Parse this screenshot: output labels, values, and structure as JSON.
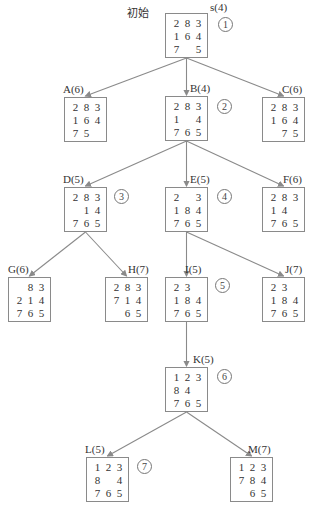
{
  "diagram": {
    "type": "search-tree",
    "start_label": "初始",
    "nodes": [
      {
        "id": "s",
        "label": "s(4)",
        "order": "1",
        "x": 165,
        "y": 13,
        "lx": 210,
        "ly": 1,
        "ox": 218,
        "oy": 17,
        "tiles": [
          "2",
          "8",
          "3",
          "1",
          "6",
          "4",
          "7",
          "",
          "5"
        ]
      },
      {
        "id": "A",
        "label": "A(6)",
        "order": "",
        "x": 64,
        "y": 97,
        "lx": 63,
        "ly": 83,
        "tiles": [
          "2",
          "8",
          "3",
          "1",
          "6",
          "4",
          "7",
          "5",
          ""
        ]
      },
      {
        "id": "B",
        "label": "B(4)",
        "order": "2",
        "x": 165,
        "y": 96,
        "lx": 190,
        "ly": 82,
        "ox": 217,
        "oy": 99,
        "tiles": [
          "2",
          "8",
          "3",
          "1",
          "",
          "4",
          "7",
          "6",
          "5"
        ]
      },
      {
        "id": "C",
        "label": "C(6)",
        "order": "",
        "x": 262,
        "y": 97,
        "lx": 282,
        "ly": 83,
        "tiles": [
          "2",
          "8",
          "3",
          "1",
          "6",
          "4",
          "",
          "7",
          "5"
        ]
      },
      {
        "id": "D",
        "label": "D(5)",
        "order": "3",
        "x": 64,
        "y": 187,
        "lx": 63,
        "ly": 173,
        "ox": 114,
        "oy": 189,
        "tiles": [
          "2",
          "8",
          "3",
          "",
          "1",
          "4",
          "7",
          "6",
          "5"
        ]
      },
      {
        "id": "E",
        "label": "E(5)",
        "order": "4",
        "x": 165,
        "y": 187,
        "lx": 190,
        "ly": 173,
        "ox": 217,
        "oy": 189,
        "tiles": [
          "2",
          "",
          "3",
          "1",
          "8",
          "4",
          "7",
          "6",
          "5"
        ]
      },
      {
        "id": "F",
        "label": "F(6)",
        "order": "",
        "x": 262,
        "y": 187,
        "lx": 283,
        "ly": 173,
        "tiles": [
          "2",
          "8",
          "3",
          "1",
          "4",
          "",
          "7",
          "6",
          "5"
        ]
      },
      {
        "id": "G",
        "label": "G(6)",
        "order": "",
        "x": 8,
        "y": 277,
        "lx": 8,
        "ly": 263,
        "tiles": [
          "",
          "8",
          "3",
          "2",
          "1",
          "4",
          "7",
          "6",
          "5"
        ]
      },
      {
        "id": "H",
        "label": "H(7)",
        "order": "",
        "x": 105,
        "y": 277,
        "lx": 128,
        "ly": 263,
        "tiles": [
          "2",
          "8",
          "3",
          "7",
          "1",
          "4",
          "",
          "6",
          "5"
        ]
      },
      {
        "id": "I",
        "label": "I(5)",
        "order": "5",
        "x": 165,
        "y": 277,
        "lx": 185,
        "ly": 263,
        "ox": 215,
        "oy": 278,
        "tiles": [
          "2",
          "3",
          "",
          "1",
          "8",
          "4",
          "7",
          "6",
          "5"
        ]
      },
      {
        "id": "J",
        "label": "J(7)",
        "order": "",
        "x": 262,
        "y": 277,
        "lx": 285,
        "ly": 263,
        "tiles": [
          "2",
          "3",
          "",
          "1",
          "8",
          "4",
          "7",
          "6",
          "5"
        ]
      },
      {
        "id": "K",
        "label": "K(5)",
        "order": "6",
        "x": 165,
        "y": 367,
        "lx": 193,
        "ly": 353,
        "ox": 217,
        "oy": 369,
        "tiles": [
          "1",
          "2",
          "3",
          "8",
          "4",
          "",
          "7",
          "6",
          "5"
        ]
      },
      {
        "id": "L",
        "label": "L(5)",
        "order": "7",
        "x": 86,
        "y": 457,
        "lx": 85,
        "ly": 443,
        "ox": 137,
        "oy": 459,
        "tiles": [
          "1",
          "2",
          "3",
          "8",
          "",
          "4",
          "7",
          "6",
          "5"
        ]
      },
      {
        "id": "M",
        "label": "M(7)",
        "order": "",
        "x": 230,
        "y": 457,
        "lx": 248,
        "ly": 443,
        "tiles": [
          "1",
          "2",
          "3",
          "7",
          "8",
          "4",
          "",
          "6",
          "5"
        ]
      }
    ],
    "edges": [
      [
        "s",
        "A"
      ],
      [
        "s",
        "B"
      ],
      [
        "s",
        "C"
      ],
      [
        "B",
        "D"
      ],
      [
        "B",
        "E"
      ],
      [
        "B",
        "F"
      ],
      [
        "D",
        "G"
      ],
      [
        "D",
        "H"
      ],
      [
        "E",
        "I"
      ],
      [
        "E",
        "J"
      ],
      [
        "I",
        "K"
      ],
      [
        "K",
        "L"
      ],
      [
        "K",
        "M"
      ]
    ],
    "colors": {
      "edge": "#8a8a8a",
      "border": "#8a8a8a",
      "text": "#333333"
    }
  }
}
